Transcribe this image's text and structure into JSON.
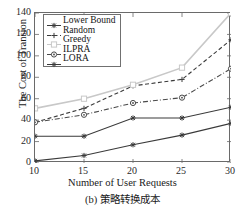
{
  "figure": {
    "caption": "(b) 策略转换成本"
  },
  "axes": {
    "xlabel": "Number of User Requests",
    "ylabel": "The Cost of Transion",
    "xticks": [
      "10",
      "15",
      "20",
      "25",
      "30"
    ],
    "yticks": [
      "0",
      "20",
      "40",
      "60",
      "80",
      "100",
      "120",
      "140"
    ]
  },
  "legend": {
    "items": [
      {
        "label": "Lower Bound",
        "marker": "star-marker",
        "color": "#3a3a3a",
        "dash": "solid"
      },
      {
        "label": "Random",
        "marker": "plus-marker",
        "color": "#3a3a3a",
        "dash": "dashed"
      },
      {
        "label": "Greedy",
        "marker": "open-square-marker",
        "color": "#c8c8c8",
        "dash": "solid"
      },
      {
        "label": "ILPRA",
        "marker": "circle-marker",
        "color": "#4a4a4a",
        "dash": "dashdot"
      },
      {
        "label": "LORA",
        "marker": "star-marker",
        "color": "#3a3a3a",
        "dash": "solid"
      }
    ]
  },
  "chart_data": {
    "type": "line",
    "title": "",
    "xlabel": "Number of User Requests",
    "ylabel": "The Cost of Transion",
    "x": [
      10,
      15,
      20,
      25,
      30
    ],
    "xlim": [
      10,
      30
    ],
    "ylim": [
      0,
      140
    ],
    "grid": false,
    "legend_position": "upper-left-inside",
    "series": [
      {
        "name": "Lower Bound",
        "values": [
          2,
          7,
          17,
          26,
          37
        ],
        "color": "#3a3a3a",
        "marker": "star",
        "dash": "solid"
      },
      {
        "name": "Random",
        "values": [
          38,
          51,
          72,
          78,
          115
        ],
        "color": "#3a3a3a",
        "marker": "plus",
        "dash": "dashed"
      },
      {
        "name": "Greedy",
        "values": [
          51,
          60,
          73,
          89,
          140
        ],
        "color": "#c8c8c8",
        "marker": "square",
        "dash": "solid"
      },
      {
        "name": "ILPRA",
        "values": [
          38,
          45,
          56,
          61,
          88
        ],
        "color": "#4a4a4a",
        "marker": "circle",
        "dash": "dashdot"
      },
      {
        "name": "LORA",
        "values": [
          25,
          25,
          42,
          42,
          52
        ],
        "color": "#3a3a3a",
        "marker": "star",
        "dash": "solid"
      }
    ]
  }
}
